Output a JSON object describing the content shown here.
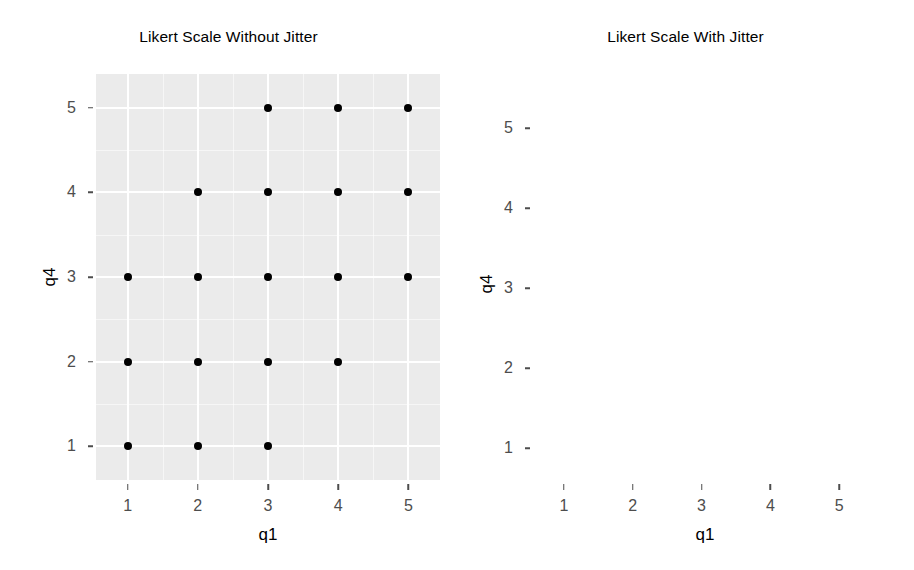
{
  "chart_data": [
    {
      "type": "scatter",
      "panel": "left",
      "title": "Likert Scale Without Jitter",
      "xlabel": "q1",
      "ylabel": "q4",
      "xlim": [
        0.55,
        5.45
      ],
      "ylim": [
        0.6,
        5.4
      ],
      "xticks": [
        1,
        2,
        3,
        4,
        5
      ],
      "yticks": [
        1,
        2,
        3,
        4,
        5
      ],
      "xtick_labels": [
        "1",
        "2",
        "3",
        "4",
        "5"
      ],
      "ytick_labels": [
        "1",
        "2",
        "3",
        "4",
        "5"
      ],
      "grid": true,
      "grid_minor": true,
      "legend": "none",
      "points": [
        [
          1,
          1
        ],
        [
          2,
          1
        ],
        [
          3,
          1
        ],
        [
          1,
          2
        ],
        [
          2,
          2
        ],
        [
          3,
          2
        ],
        [
          4,
          2
        ],
        [
          1,
          3
        ],
        [
          2,
          3
        ],
        [
          3,
          3
        ],
        [
          4,
          3
        ],
        [
          5,
          3
        ],
        [
          2,
          4
        ],
        [
          3,
          4
        ],
        [
          4,
          4
        ],
        [
          5,
          4
        ],
        [
          3,
          5
        ],
        [
          4,
          5
        ],
        [
          5,
          5
        ]
      ]
    },
    {
      "type": "scatter",
      "panel": "right",
      "title": "Likert Scale With Jitter",
      "xlabel": "q1",
      "ylabel": "q4",
      "xlim": [
        0.55,
        5.55
      ],
      "ylim": [
        0.6,
        5.5
      ],
      "xticks": [
        1,
        2,
        3,
        4,
        5
      ],
      "yticks": [
        1,
        2,
        3,
        4,
        5
      ],
      "xtick_labels": [
        "1",
        "2",
        "3",
        "4",
        "5"
      ],
      "ytick_labels": [
        "1",
        "2",
        "3",
        "4",
        "5"
      ],
      "grid": true,
      "grid_minor": true,
      "legend": "none",
      "points": [
        [
          0.78,
          0.82
        ],
        [
          1.95,
          0.78
        ],
        [
          2.93,
          0.97
        ],
        [
          1.28,
          1.19
        ],
        [
          1.72,
          1.37
        ],
        [
          2.32,
          1.33
        ],
        [
          0.74,
          1.85
        ],
        [
          1.62,
          2.06
        ],
        [
          2.02,
          2.33
        ],
        [
          2.63,
          2.22
        ],
        [
          2.9,
          1.82
        ],
        [
          3.22,
          1.71
        ],
        [
          3.52,
          1.74
        ],
        [
          4.05,
          2.05
        ],
        [
          0.78,
          3.2
        ],
        [
          1.38,
          2.74
        ],
        [
          1.72,
          2.9
        ],
        [
          2.07,
          2.62
        ],
        [
          2.4,
          3.0
        ],
        [
          2.62,
          2.79
        ],
        [
          2.78,
          3.08
        ],
        [
          2.86,
          2.66
        ],
        [
          2.95,
          3.32
        ],
        [
          3.05,
          2.87
        ],
        [
          3.18,
          3.12
        ],
        [
          3.28,
          2.74
        ],
        [
          3.42,
          3.35
        ],
        [
          3.6,
          2.95
        ],
        [
          3.74,
          2.72
        ],
        [
          3.9,
          3.0
        ],
        [
          4.2,
          2.88
        ],
        [
          4.38,
          3.07
        ],
        [
          4.62,
          3.18
        ],
        [
          4.78,
          2.9
        ],
        [
          4.9,
          3.0
        ],
        [
          5.05,
          2.74
        ],
        [
          4.45,
          2.62
        ],
        [
          1.62,
          4.0
        ],
        [
          2.28,
          3.62
        ],
        [
          2.6,
          3.72
        ],
        [
          2.72,
          3.5
        ],
        [
          2.88,
          3.9
        ],
        [
          3.0,
          3.77
        ],
        [
          3.12,
          4.18
        ],
        [
          3.22,
          4.2
        ],
        [
          3.35,
          3.62
        ],
        [
          3.48,
          3.95
        ],
        [
          3.6,
          3.78
        ],
        [
          3.72,
          4.12
        ],
        [
          3.85,
          4.3
        ],
        [
          3.92,
          4.22
        ],
        [
          4.02,
          4.4
        ],
        [
          4.1,
          4.15
        ],
        [
          4.18,
          4.02
        ],
        [
          4.3,
          3.62
        ],
        [
          4.42,
          3.85
        ],
        [
          4.55,
          4.05
        ],
        [
          4.68,
          3.92
        ],
        [
          4.82,
          4.22
        ],
        [
          5.12,
          4.18
        ],
        [
          5.3,
          4.1
        ],
        [
          2.9,
          5.3
        ],
        [
          3.2,
          4.95
        ],
        [
          3.42,
          4.65
        ],
        [
          3.55,
          4.78
        ],
        [
          3.68,
          5.05
        ],
        [
          3.82,
          4.72
        ],
        [
          3.95,
          5.12
        ],
        [
          4.05,
          4.9
        ],
        [
          4.18,
          4.98
        ],
        [
          4.32,
          4.7
        ],
        [
          4.45,
          5.22
        ],
        [
          4.6,
          5.28
        ],
        [
          4.72,
          5.02
        ],
        [
          4.85,
          5.18
        ],
        [
          4.95,
          5.3
        ],
        [
          5.05,
          4.95
        ],
        [
          5.15,
          5.22
        ],
        [
          5.3,
          4.85
        ],
        [
          4.55,
          4.62
        ],
        [
          5.22,
          5.05
        ],
        [
          3.05,
          4.42
        ],
        [
          4.72,
          4.55
        ]
      ]
    }
  ]
}
